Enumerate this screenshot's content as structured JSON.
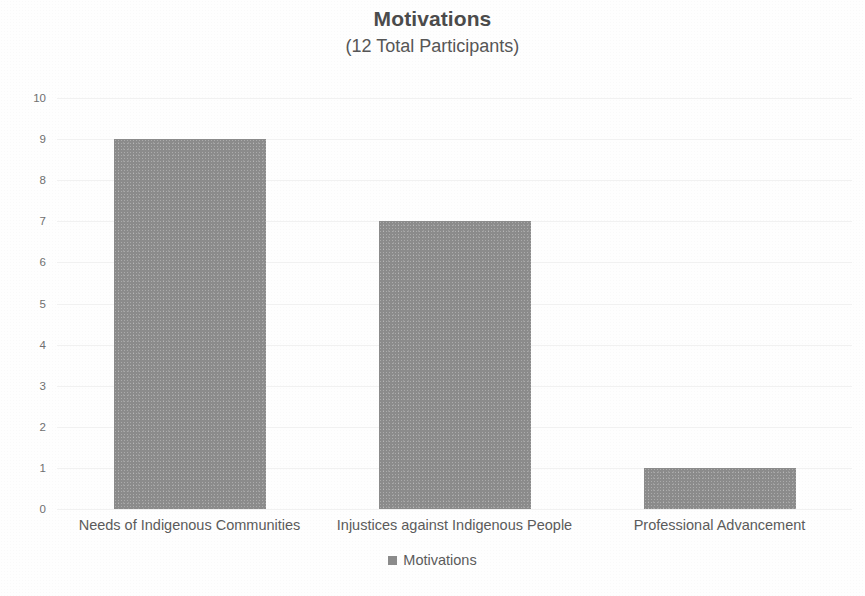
{
  "chart_data": {
    "type": "bar",
    "title": "Motivations",
    "subtitle": "(12 Total Participants)",
    "categories": [
      "Needs of Indigenous Communities",
      "Injustices against Indigenous People",
      "Professional Advancement"
    ],
    "values": [
      9,
      7,
      1
    ],
    "series": [
      {
        "name": "Motivations",
        "values": [
          9,
          7,
          1
        ]
      }
    ],
    "xlabel": "",
    "ylabel": "",
    "ylim": [
      0,
      10
    ],
    "y_ticks": [
      10,
      9,
      8,
      7,
      6,
      5,
      4,
      3,
      2,
      1,
      0
    ],
    "y_tick_step": 1,
    "grid": true,
    "grid_axis": "y",
    "legend": {
      "position": "bottom",
      "entries": [
        {
          "label": "Motivations",
          "color": "#8b8b8b"
        }
      ]
    },
    "colors": {
      "bar": "#8b8b8b",
      "title": "#4b4b4b",
      "subtitle": "#565656",
      "tick_label": "#6f6f6f",
      "category_label": "#5b5b5b",
      "gridline": "#f1f1f1",
      "background": "#fefefe"
    }
  }
}
